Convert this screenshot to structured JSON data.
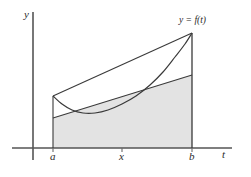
{
  "figure": {
    "background_color": "#ffffff",
    "axis_color": "#555555",
    "curve_color": "#3a3a3a",
    "line_color": "#3a3a3a",
    "shade_color": "#e3e3e3",
    "text_color": "#2b2b2b"
  },
  "axes": {
    "y_axis_label": "y",
    "t_axis_label": "t",
    "y_axis_x": 33,
    "x_axis_y": 148,
    "x_axis_start": 12,
    "x_axis_end": 232,
    "y_axis_top": 12,
    "y_axis_bottom": 160
  },
  "ticks": [
    {
      "name": "a",
      "label": "a",
      "x": 53
    },
    {
      "name": "x",
      "label": "x",
      "x": 122
    },
    {
      "name": "b",
      "label": "b",
      "x": 192
    }
  ],
  "curve_label": "y = f(t)",
  "chart_data": {
    "type": "line",
    "title": "",
    "xlabel": "t",
    "ylabel": "y",
    "grid": false,
    "legend": "none",
    "annotations": [
      {
        "text": "y = f(t)",
        "x": 179,
        "y": 16
      },
      {
        "text": "a",
        "x": 50,
        "y": 151
      },
      {
        "text": "x",
        "x": 119,
        "y": 151
      },
      {
        "text": "b",
        "x": 189,
        "y": 151
      }
    ],
    "series": [
      {
        "name": "f(t) curve",
        "kind": "curve",
        "points_px": [
          [
            53,
            96
          ],
          [
            62,
            104
          ],
          [
            72,
            110
          ],
          [
            83,
            113
          ],
          [
            95,
            113
          ],
          [
            108,
            110
          ],
          [
            122,
            104
          ],
          [
            136,
            96
          ],
          [
            150,
            85
          ],
          [
            163,
            72
          ],
          [
            175,
            57
          ],
          [
            185,
            44
          ],
          [
            192,
            33
          ]
        ]
      },
      {
        "name": "upper chord",
        "kind": "segment",
        "points_px": [
          [
            53,
            96
          ],
          [
            192,
            33
          ]
        ]
      },
      {
        "name": "lower secant",
        "kind": "segment",
        "points_px": [
          [
            53,
            118
          ],
          [
            192,
            75
          ]
        ]
      },
      {
        "name": "left ordinate at a",
        "kind": "segment",
        "points_px": [
          [
            53,
            96
          ],
          [
            53,
            148
          ]
        ]
      },
      {
        "name": "right ordinate at b",
        "kind": "segment",
        "points_px": [
          [
            192,
            33
          ],
          [
            192,
            148
          ]
        ]
      }
    ],
    "shaded_region": {
      "name": "area-under-lower-secant",
      "fill": "#e3e3e3",
      "polygon_px": [
        [
          53,
          118
        ],
        [
          192,
          75
        ],
        [
          192,
          148
        ],
        [
          53,
          148
        ]
      ]
    }
  }
}
